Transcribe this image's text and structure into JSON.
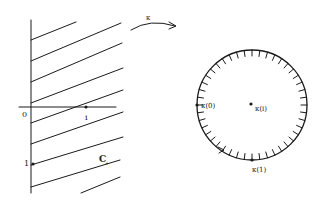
{
  "figure": {
    "ink_color": "#1a1a1a",
    "background": "#ffffff"
  },
  "half_plane": {
    "origin_label": "0",
    "real_point_label": "i",
    "imag_point_label": "1",
    "region_label": "C+",
    "region_label_main": "C",
    "region_label_sub": "+"
  },
  "map_arrow": {
    "label": "κ"
  },
  "disk": {
    "center_label": "κ(i)",
    "left_point_label": "κ(0)",
    "bottom_point_label": "κ(1)"
  }
}
